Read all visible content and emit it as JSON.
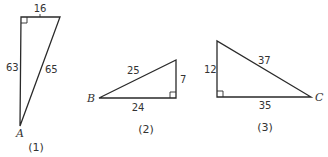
{
  "triangles": [
    {
      "caption": "(1)",
      "vertex_label": "A",
      "sides": {
        "top": "16",
        "left": "63",
        "hypotenuse": "65"
      }
    },
    {
      "caption": "(2)",
      "vertex_label": "B",
      "sides": {
        "hypotenuse": "25",
        "right": "7",
        "bottom": "24"
      }
    },
    {
      "caption": "(3)",
      "vertex_label": "C",
      "sides": {
        "left": "12",
        "hypotenuse": "37",
        "bottom": "35"
      }
    }
  ]
}
